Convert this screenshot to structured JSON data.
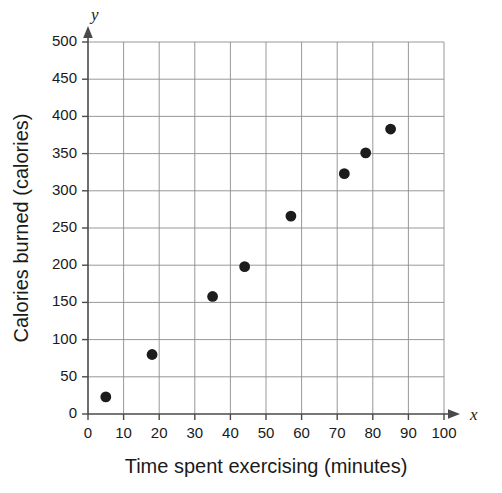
{
  "chart_data": {
    "type": "scatter",
    "title": "",
    "xlabel": "Time spent exercising (minutes)",
    "ylabel": "Calories burned (calories)",
    "x_axis_letter": "x",
    "y_axis_letter": "y",
    "xlim": [
      0,
      100
    ],
    "ylim": [
      0,
      500
    ],
    "x_ticks": [
      0,
      10,
      20,
      30,
      40,
      50,
      60,
      70,
      80,
      90,
      100
    ],
    "y_ticks": [
      0,
      50,
      100,
      150,
      200,
      250,
      300,
      350,
      400,
      450,
      500
    ],
    "x_tick_labels": [
      "0",
      "10",
      "20",
      "30",
      "40",
      "50",
      "60",
      "70",
      "80",
      "90",
      "100"
    ],
    "y_tick_labels": [
      "0",
      "50",
      "100",
      "150",
      "200",
      "250",
      "300",
      "350",
      "400",
      "450",
      "500"
    ],
    "grid": true,
    "legend": null,
    "marker": "filled-circle",
    "marker_color": "#1c1c1c",
    "grid_color": "#8c8c8c",
    "axis_color": "#4a4a4a",
    "points": [
      {
        "x": 5,
        "y": 23
      },
      {
        "x": 18,
        "y": 80
      },
      {
        "x": 35,
        "y": 158
      },
      {
        "x": 44,
        "y": 198
      },
      {
        "x": 57,
        "y": 266
      },
      {
        "x": 72,
        "y": 323
      },
      {
        "x": 78,
        "y": 351
      },
      {
        "x": 85,
        "y": 383
      }
    ]
  }
}
